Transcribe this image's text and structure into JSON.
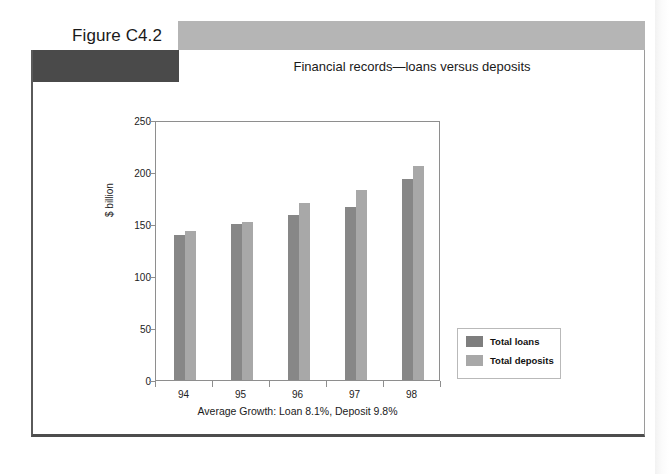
{
  "figure": {
    "label": "Figure C4.2",
    "title": "Financial records—loans versus deposits",
    "caption": "Average Growth: Loan 8.1%, Deposit 9.8%"
  },
  "colors": {
    "banner": "#b5b5b5",
    "dark_block": "#4a4a4a",
    "loans": "#878787",
    "deposits": "#a8a8a8",
    "axis": "#8e8e8e"
  },
  "chart_data": {
    "type": "bar",
    "title": "Financial records—loans versus deposits",
    "xlabel": "Average Growth: Loan 8.1%, Deposit 9.8%",
    "ylabel": "$ billion",
    "categories": [
      "94",
      "95",
      "96",
      "97",
      "98"
    ],
    "yticks": [
      0,
      50,
      100,
      150,
      200,
      250
    ],
    "ylim": [
      0,
      250
    ],
    "grid": false,
    "legend_position": "right",
    "series": [
      {
        "name": "Total loans",
        "color": "#878787",
        "values": [
          141,
          152,
          161,
          168,
          195
        ]
      },
      {
        "name": "Total deposits",
        "color": "#a8a8a8",
        "values": [
          145,
          154,
          172,
          185,
          208
        ]
      }
    ]
  }
}
